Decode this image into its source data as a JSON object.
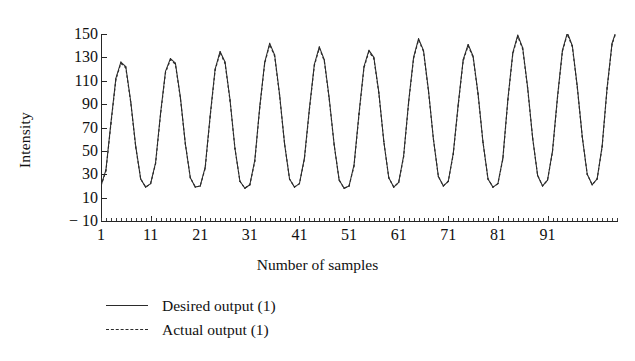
{
  "chart_data": {
    "type": "line",
    "title": "",
    "xlabel": "Number of samples",
    "ylabel": "Intensity",
    "xlim": [
      1,
      105
    ],
    "ylim": [
      -10,
      150
    ],
    "grid": false,
    "legend_position": "below-axes",
    "xticks": [
      1,
      11,
      21,
      31,
      41,
      51,
      61,
      71,
      81,
      91
    ],
    "yticks": [
      -10,
      10,
      30,
      50,
      70,
      90,
      110,
      130,
      150
    ],
    "series": [
      {
        "name": "Desired output (1)",
        "style": "solid",
        "color": "#2b2b2b",
        "x": [
          1,
          2,
          3,
          4,
          5,
          6,
          7,
          8,
          9,
          10,
          11,
          12,
          13,
          14,
          15,
          16,
          17,
          18,
          19,
          20,
          21,
          22,
          23,
          24,
          25,
          26,
          27,
          28,
          29,
          30,
          31,
          32,
          33,
          34,
          35,
          36,
          37,
          38,
          39,
          40,
          41,
          42,
          43,
          44,
          45,
          46,
          47,
          48,
          49,
          50,
          51,
          52,
          53,
          54,
          55,
          56,
          57,
          58,
          59,
          60,
          61,
          62,
          63,
          64,
          65,
          66,
          67,
          68,
          69,
          70,
          71,
          72,
          73,
          74,
          75,
          76,
          77,
          78,
          79,
          80,
          81,
          82,
          83,
          84,
          85,
          86,
          87,
          88,
          89,
          90,
          91,
          92,
          93,
          94,
          95,
          96,
          97,
          98,
          99,
          100,
          101,
          102,
          103,
          104,
          105
        ],
        "y": [
          20,
          34,
          74,
          112,
          126,
          122,
          92,
          54,
          26,
          19,
          22,
          40,
          82,
          118,
          129,
          125,
          96,
          56,
          27,
          19,
          20,
          36,
          80,
          120,
          135,
          126,
          94,
          52,
          24,
          18,
          21,
          42,
          88,
          126,
          142,
          132,
          98,
          56,
          26,
          19,
          22,
          44,
          86,
          124,
          139,
          128,
          95,
          55,
          25,
          18,
          20,
          38,
          82,
          122,
          136,
          130,
          100,
          58,
          27,
          19,
          23,
          46,
          92,
          130,
          146,
          136,
          102,
          60,
          28,
          20,
          24,
          48,
          90,
          128,
          141,
          131,
          99,
          57,
          26,
          19,
          22,
          44,
          94,
          134,
          149,
          138,
          104,
          61,
          29,
          20,
          25,
          50,
          96,
          136,
          151,
          140,
          105,
          62,
          30,
          21,
          26,
          54,
          104,
          142,
          155
        ]
      },
      {
        "name": "Actual output (1)",
        "style": "dashed",
        "color": "#2b2b2b",
        "x": [
          1,
          2,
          3,
          4,
          5,
          6,
          7,
          8,
          9,
          10,
          11,
          12,
          13,
          14,
          15,
          16,
          17,
          18,
          19,
          20,
          21,
          22,
          23,
          24,
          25,
          26,
          27,
          28,
          29,
          30,
          31,
          32,
          33,
          34,
          35,
          36,
          37,
          38,
          39,
          40,
          41,
          42,
          43,
          44,
          45,
          46,
          47,
          48,
          49,
          50,
          51,
          52,
          53,
          54,
          55,
          56,
          57,
          58,
          59,
          60,
          61,
          62,
          63,
          64,
          65,
          66,
          67,
          68,
          69,
          70,
          71,
          72,
          73,
          74,
          75,
          76,
          77,
          78,
          79,
          80,
          81,
          82,
          83,
          84,
          85,
          86,
          87,
          88,
          89,
          90,
          91,
          92,
          93,
          94,
          95,
          96,
          97,
          98,
          99,
          100,
          101,
          102,
          103,
          104,
          105
        ],
        "y": [
          20,
          33,
          73,
          111,
          125,
          121,
          91,
          53,
          26,
          19,
          22,
          39,
          81,
          117,
          128,
          124,
          95,
          56,
          27,
          19,
          20,
          35,
          79,
          119,
          134,
          125,
          93,
          52,
          24,
          18,
          21,
          41,
          87,
          125,
          141,
          131,
          97,
          56,
          26,
          19,
          22,
          43,
          85,
          123,
          138,
          127,
          94,
          55,
          25,
          18,
          20,
          37,
          81,
          121,
          135,
          129,
          99,
          58,
          27,
          19,
          23,
          45,
          91,
          129,
          145,
          135,
          101,
          60,
          28,
          20,
          24,
          47,
          89,
          127,
          140,
          130,
          98,
          57,
          26,
          19,
          22,
          43,
          93,
          133,
          148,
          137,
          103,
          61,
          29,
          20,
          25,
          49,
          95,
          135,
          150,
          139,
          104,
          62,
          30,
          21,
          26,
          53,
          103,
          141,
          154
        ]
      }
    ]
  },
  "axes": {
    "ylabel_text": "Intensity",
    "xlabel_text": "Number of samples"
  },
  "legend": {
    "entries": [
      {
        "label": "Desired output (1)",
        "style": "solid"
      },
      {
        "label": "Actual output (1)",
        "style": "dashed"
      }
    ]
  }
}
